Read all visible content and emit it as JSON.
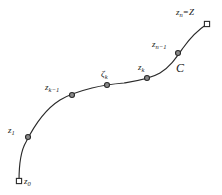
{
  "figure": {
    "kind": "contour-partition-diagram",
    "background_color": "#ffffff",
    "stroke_color": "#2a2a2a",
    "label_color": "#1a1a1a",
    "curve_label": "C",
    "curve_label_position": {
      "x": 176,
      "y": 62
    },
    "points": [
      {
        "id": "z0",
        "base": "z",
        "sub": "0",
        "marker": "square",
        "x": 19,
        "y": 181,
        "label_x": 24,
        "label_y": 177
      },
      {
        "id": "z1",
        "base": "z",
        "sub": "1",
        "marker": "circle",
        "x": 28,
        "y": 137,
        "label_x": 8,
        "label_y": 126
      },
      {
        "id": "zk-1",
        "base": "z",
        "sub": "k−1",
        "marker": "circle",
        "x": 72,
        "y": 95,
        "label_x": 45,
        "label_y": 83
      },
      {
        "id": "zetak",
        "base": "ζ",
        "sub": "k",
        "marker": "circle",
        "x": 107,
        "y": 85,
        "label_x": 101,
        "label_y": 70
      },
      {
        "id": "zk",
        "base": "z",
        "sub": "k",
        "marker": "circle",
        "x": 147,
        "y": 78,
        "label_x": 138,
        "label_y": 63
      },
      {
        "id": "zn-1",
        "base": "z",
        "sub": "n−1",
        "marker": "circle",
        "x": 178,
        "y": 53,
        "label_x": 152,
        "label_y": 40
      },
      {
        "id": "zn",
        "base": "z",
        "sub": "n",
        "marker": "square",
        "equals": "=",
        "equals_rhs": "Z",
        "x": 207,
        "y": 24,
        "label_x": 176,
        "label_y": 8
      }
    ],
    "curve_path": "M 19,181 C 19,168 20,152 26,142 C 32,130 44,110 60,100 C 68,95 80,91 92,88 C 100,86 112,84 124,83 C 136,81 150,79 160,73 C 170,67 176,58 183,48 C 190,38 198,30 207,24"
  }
}
